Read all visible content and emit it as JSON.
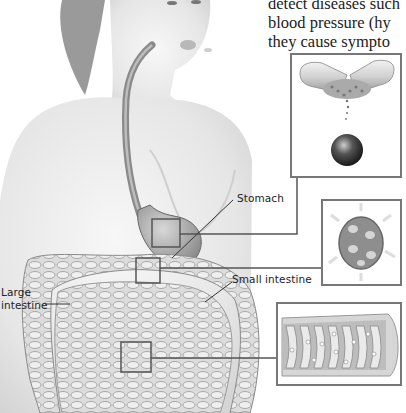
{
  "body_text": {
    "lines": [
      "detect diseases such",
      "blood pressure (hy",
      "they cause sympto"
    ]
  },
  "labels": {
    "stomach": "Stomach",
    "small_intestine": "Small intestine",
    "large_intestine_line1": "Large",
    "large_intestine_line2": "intestine"
  },
  "insets": [
    {
      "name": "capsule-dissolving",
      "description": "Capsule opening and releasing granules; sphere tablet below"
    },
    {
      "name": "stomach-cell",
      "description": "Round granule/cell dissolving in stomach"
    },
    {
      "name": "intestinal-villi",
      "description": "Cross-section of small intestine wall with villi absorbing particles"
    }
  ],
  "colors": {
    "skin": "#e9e9e9",
    "shadow": "#b5b5b5",
    "esophagus": "#8a8a8a",
    "leader_line": "#444444",
    "inset_border": "#777777"
  }
}
